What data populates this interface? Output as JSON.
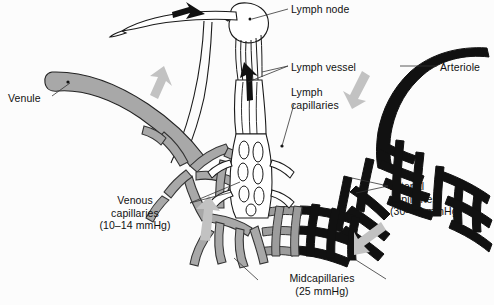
{
  "figure": {
    "type": "anatomical-diagram",
    "background_color": "#fcfcfc",
    "colors": {
      "arterial": "#111111",
      "venous": "#a8a8a8",
      "lymphatic": "#ffffff",
      "outline": "#1a1a1a",
      "flow_arrow_gray": "#c2c2c2",
      "flow_arrow_black": "#111111",
      "leader_line": "#333333",
      "text": "#111111"
    }
  },
  "labels": {
    "lymph_node": "Lymph node",
    "lymph_vessel": "Lymph vessel",
    "lymph_capillaries": "Lymph\ncapillaries",
    "arteriole": "Arteriole",
    "venule": "Venule",
    "venous_capillaries": "Venous\ncapillaries\n(10–14 mmHg)",
    "arterial_capillaries": "Arterial\ncapillaries\n(30–40 mmHg)",
    "midcapillaries": "Midcapillaries\n(25 mmHg)"
  },
  "pressures": [
    {
      "region": "Arterial capillaries",
      "value": "30–40 mmHg"
    },
    {
      "region": "Midcapillaries",
      "value": "25 mmHg"
    },
    {
      "region": "Venous capillaries",
      "value": "10–14 mmHg"
    }
  ],
  "structures": [
    {
      "name": "arteriole",
      "fill": "black",
      "description": "thick solid black vessel entering from upper right"
    },
    {
      "name": "arterial-capillary-network",
      "fill": "black",
      "description": "dark branching mesh on the right"
    },
    {
      "name": "midcapillary-network",
      "fill": "black-to-gray",
      "description": "transition mesh at the bottom centre"
    },
    {
      "name": "venous-capillary-network",
      "fill": "gray",
      "description": "light gray branching mesh on the left"
    },
    {
      "name": "venule",
      "fill": "gray",
      "description": "thick gray vessel exiting to the upper left"
    },
    {
      "name": "lymph-capillaries",
      "fill": "white",
      "description": "unfilled outlined blind-ended mesh in the centre"
    },
    {
      "name": "lymph-vessel",
      "fill": "white",
      "description": "outlined vessel running upward to the node"
    },
    {
      "name": "lymph-node",
      "fill": "white",
      "description": "bean-shaped outlined node at the top"
    }
  ],
  "flow_arrows": [
    {
      "name": "lymph-efferent-arrow",
      "color": "black",
      "direction": "left"
    },
    {
      "name": "lymph-afferent-arrow",
      "color": "black",
      "direction": "up"
    },
    {
      "name": "venous-return-arrow-upper",
      "color": "gray",
      "direction": "up-left"
    },
    {
      "name": "venous-return-arrow-lower",
      "color": "gray",
      "direction": "up"
    },
    {
      "name": "arterial-inflow-arrow-upper",
      "color": "gray",
      "direction": "down-left"
    },
    {
      "name": "arterial-inflow-arrow-lower",
      "color": "gray",
      "direction": "down-left"
    }
  ]
}
